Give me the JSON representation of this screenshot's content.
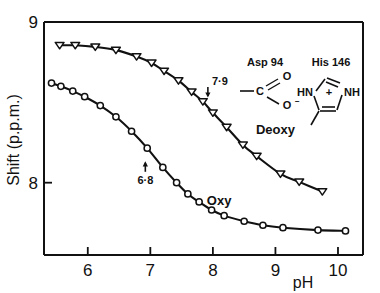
{
  "chart_data": {
    "type": "line",
    "title": "",
    "xlabel": "pH",
    "ylabel": "Shift (p.p.m.)",
    "xlim": [
      5.3,
      10.4
    ],
    "ylim": [
      7.55,
      9.0
    ],
    "xticks": [
      "6",
      "7",
      "8",
      "9",
      "10"
    ],
    "xtick_values": [
      6,
      7,
      8,
      9,
      10
    ],
    "yticks": [
      "8",
      "9"
    ],
    "ytick_values": [
      8,
      9
    ],
    "grid": false,
    "legend_position": "inline-curve-labels",
    "series": [
      {
        "name": "Deoxy",
        "marker": "open-triangle-down",
        "label_x": 9.0,
        "label_y": 8.3,
        "points": [
          {
            "x": 5.55,
            "y": 8.855
          },
          {
            "x": 5.8,
            "y": 8.855
          },
          {
            "x": 6.12,
            "y": 8.845
          },
          {
            "x": 6.45,
            "y": 8.825
          },
          {
            "x": 6.78,
            "y": 8.785
          },
          {
            "x": 7.02,
            "y": 8.745
          },
          {
            "x": 7.22,
            "y": 8.695
          },
          {
            "x": 7.45,
            "y": 8.635
          },
          {
            "x": 7.66,
            "y": 8.565
          },
          {
            "x": 7.84,
            "y": 8.505
          },
          {
            "x": 8.0,
            "y": 8.435
          },
          {
            "x": 8.22,
            "y": 8.345
          },
          {
            "x": 8.48,
            "y": 8.235
          },
          {
            "x": 8.7,
            "y": 8.165
          },
          {
            "x": 9.08,
            "y": 8.055
          },
          {
            "x": 9.38,
            "y": 8.005
          },
          {
            "x": 9.75,
            "y": 7.945
          }
        ]
      },
      {
        "name": "Oxy",
        "marker": "open-circle",
        "label_x": 8.1,
        "label_y": 7.86,
        "points": [
          {
            "x": 5.42,
            "y": 8.62
          },
          {
            "x": 5.57,
            "y": 8.6
          },
          {
            "x": 5.76,
            "y": 8.57
          },
          {
            "x": 5.95,
            "y": 8.535
          },
          {
            "x": 6.2,
            "y": 8.48
          },
          {
            "x": 6.45,
            "y": 8.41
          },
          {
            "x": 6.7,
            "y": 8.32
          },
          {
            "x": 6.95,
            "y": 8.215
          },
          {
            "x": 7.2,
            "y": 8.095
          },
          {
            "x": 7.42,
            "y": 8.0
          },
          {
            "x": 7.6,
            "y": 7.93
          },
          {
            "x": 7.78,
            "y": 7.88
          },
          {
            "x": 7.98,
            "y": 7.83
          },
          {
            "x": 8.18,
            "y": 7.795
          },
          {
            "x": 8.5,
            "y": 7.76
          },
          {
            "x": 8.8,
            "y": 7.735
          },
          {
            "x": 9.12,
            "y": 7.72
          },
          {
            "x": 9.68,
            "y": 7.705
          },
          {
            "x": 10.12,
            "y": 7.7
          }
        ]
      }
    ],
    "annotations": [
      {
        "text": "7·9",
        "x": 7.92,
        "y": 8.54,
        "arrow": "down",
        "series": "Deoxy"
      },
      {
        "text": "6·8",
        "x": 6.92,
        "y": 8.13,
        "arrow": "up",
        "series": "Oxy"
      }
    ]
  },
  "structures": {
    "aspartate": {
      "title": "Asp 94",
      "atoms": {
        "carbon": "C",
        "oxygen_double": "O",
        "oxygen_anion": "O",
        "charge": "−"
      }
    },
    "histidine": {
      "title": "His 146",
      "atoms": {
        "nitrogen_left": "HN",
        "nitrogen_right": "NH",
        "charge": "+"
      }
    }
  },
  "colors": {
    "ink": "#111111",
    "background": "#ffffff"
  }
}
